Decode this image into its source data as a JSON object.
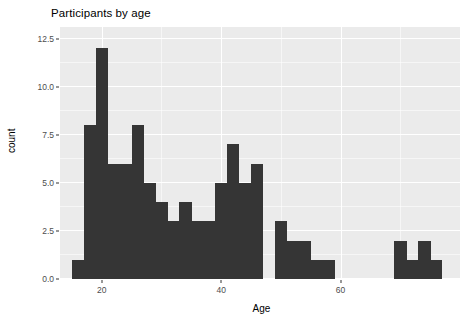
{
  "chart_data": {
    "type": "bar",
    "title": "Participants by age",
    "xlabel": "Age",
    "ylabel": "count",
    "grid": true,
    "legend": null,
    "binwidth": 2,
    "xlim": [
      13,
      80
    ],
    "ylim": [
      0,
      13.1
    ],
    "yticks": [
      0.0,
      2.5,
      5.0,
      7.5,
      10.0,
      12.5
    ],
    "ytick_labels": [
      "0.0",
      "2.5",
      "5.0",
      "7.5",
      "10.0",
      "12.5"
    ],
    "xticks": [
      20,
      40,
      60
    ],
    "xtick_labels": [
      "20",
      "40",
      "60"
    ],
    "bin_starts": [
      15,
      17,
      19,
      21,
      23,
      25,
      27,
      29,
      31,
      33,
      35,
      37,
      39,
      41,
      43,
      45,
      47,
      49,
      51,
      53,
      55,
      57,
      59,
      61,
      63,
      65,
      67,
      69,
      71,
      73,
      75
    ],
    "categories": [
      "15-17",
      "17-19",
      "19-21",
      "21-23",
      "23-25",
      "25-27",
      "27-29",
      "29-31",
      "31-33",
      "33-35",
      "35-37",
      "37-39",
      "39-41",
      "41-43",
      "43-45",
      "45-47",
      "47-49",
      "49-51",
      "51-53",
      "53-55",
      "55-57",
      "57-59",
      "59-61",
      "61-63",
      "63-65",
      "65-67",
      "67-69",
      "69-71",
      "71-73",
      "73-75",
      "75-77"
    ],
    "values": [
      1,
      8,
      12,
      6,
      6,
      8,
      5,
      4,
      3,
      4,
      3,
      3,
      5,
      7,
      5,
      6,
      0,
      3,
      2,
      2,
      1,
      1,
      0,
      0,
      0,
      0,
      0,
      2,
      1,
      2,
      1
    ],
    "bar_color": "#353535",
    "panel_color": "#ebebeb",
    "grid_color": "#ffffff"
  }
}
